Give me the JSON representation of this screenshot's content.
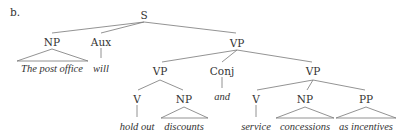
{
  "example_label": "b.",
  "nodes": {
    "s": "S",
    "np_subj": "NP",
    "aux": "Aux",
    "vp_top": "VP",
    "vp_left": "VP",
    "conj": "Conj",
    "vp_right": "VP",
    "v_left": "V",
    "np_left": "NP",
    "v_right": "V",
    "np_right": "NP",
    "pp_right": "PP"
  },
  "leaves": {
    "np_subj": "The post office",
    "aux": "will",
    "v_left": "hold out",
    "np_left": "discounts",
    "conj": "and",
    "v_right": "service",
    "np_right": "concessions",
    "pp_right": "as incentives"
  }
}
